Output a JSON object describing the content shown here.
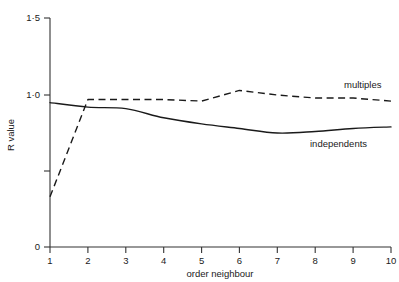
{
  "chart_data": {
    "type": "line",
    "title": "",
    "xlabel": "order neighbour",
    "ylabel": "R value",
    "xlim": [
      1,
      10
    ],
    "ylim": [
      0,
      1.5
    ],
    "grid": false,
    "legend_position": "inline-right",
    "x": [
      1,
      2,
      3,
      4,
      5,
      6,
      7,
      8,
      9,
      10
    ],
    "xticks": [
      "1",
      "2",
      "3",
      "4",
      "5",
      "6",
      "7",
      "8",
      "9",
      "10"
    ],
    "yticks": [
      "0",
      "",
      "1·0",
      "1·5"
    ],
    "ytick_values": [
      0,
      0.5,
      1.0,
      1.5
    ],
    "ytick_labeled": [
      true,
      false,
      true,
      true
    ],
    "series": [
      {
        "name": "independents",
        "style": "solid",
        "color": "#1a1a1a",
        "values": [
          0.95,
          0.92,
          0.91,
          0.85,
          0.81,
          0.78,
          0.75,
          0.76,
          0.78,
          0.79
        ]
      },
      {
        "name": "multiples",
        "style": "dashed",
        "color": "#1a1a1a",
        "values": [
          0.33,
          0.97,
          0.97,
          0.97,
          0.96,
          1.03,
          1.0,
          0.98,
          0.98,
          0.96
        ]
      }
    ],
    "annotations": [
      {
        "text": "multiples",
        "series": "multiples"
      },
      {
        "text": "independents",
        "series": "independents"
      }
    ]
  },
  "axes": {
    "y_title": "R value",
    "x_title": "order neighbour",
    "y_tick_labels": {
      "zero": "0",
      "one": "1·0",
      "one_five": "1·5"
    },
    "x_tick_labels": {
      "t1": "1",
      "t2": "2",
      "t3": "3",
      "t4": "4",
      "t5": "5",
      "t6": "6",
      "t7": "7",
      "t8": "8",
      "t9": "9",
      "t10": "10"
    }
  },
  "labels": {
    "multiples": "multiples",
    "independents": "independents"
  }
}
